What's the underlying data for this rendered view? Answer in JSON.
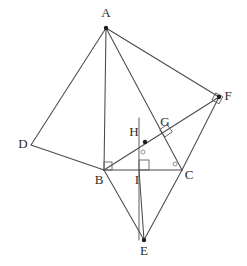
{
  "figure": {
    "canvas": {
      "width": 247,
      "height": 266
    },
    "style": {
      "background": "#ffffff",
      "line_color": "#4a4a4a",
      "label_color": "#2b2b2b",
      "mark_color": "#5a5a5a"
    },
    "points": [
      {
        "id": "A",
        "label": "A",
        "x": 106,
        "y": 28,
        "label_x": 106,
        "label_y": 14,
        "dot": true
      },
      {
        "id": "B",
        "label": "B",
        "x": 104,
        "y": 170,
        "label_x": 99,
        "label_y": 181,
        "dot": false
      },
      {
        "id": "C",
        "label": "C",
        "x": 182,
        "y": 170,
        "label_x": 189,
        "label_y": 176,
        "dot": false
      },
      {
        "id": "D",
        "label": "D",
        "x": 31,
        "y": 145,
        "label_x": 23,
        "label_y": 145,
        "dot": false
      },
      {
        "id": "E",
        "label": "E",
        "x": 144,
        "y": 240,
        "label_x": 144,
        "label_y": 252,
        "dot": true
      },
      {
        "id": "F",
        "label": "F",
        "x": 219,
        "y": 97,
        "label_x": 228,
        "label_y": 97,
        "dot": true
      },
      {
        "id": "G",
        "label": "G",
        "x": 168,
        "y": 135,
        "label_x": 165,
        "label_y": 123,
        "dot": false
      },
      {
        "id": "H",
        "label": "H",
        "x": 145,
        "y": 142,
        "label_x": 134,
        "label_y": 133,
        "dot": true
      },
      {
        "id": "I",
        "label": "I",
        "x": 139,
        "y": 170,
        "label_x": 137,
        "label_y": 181,
        "dot": false
      }
    ],
    "segments": [
      {
        "id": "AD",
        "from": "A",
        "to": "D"
      },
      {
        "id": "DB",
        "from": "D",
        "to": "B"
      },
      {
        "id": "AB",
        "from": "A",
        "to": "B"
      },
      {
        "id": "AC",
        "from": "A",
        "to": "C"
      },
      {
        "id": "AF",
        "from": "A",
        "to": "F"
      },
      {
        "id": "BF",
        "from": "B",
        "to": "F"
      },
      {
        "id": "FC",
        "from": "F",
        "to": "C"
      },
      {
        "id": "BC",
        "from": "B",
        "to": "C"
      },
      {
        "id": "BE",
        "from": "B",
        "to": "E"
      },
      {
        "id": "CE",
        "from": "C",
        "to": "E"
      },
      {
        "id": "IE",
        "from": "I",
        "to": "E"
      }
    ],
    "extra_lines": [
      {
        "id": "vertical-through-I",
        "x1": 139,
        "y1": 118,
        "x2": 139,
        "y2": 240
      }
    ],
    "angle_marks": [
      {
        "id": "right-angle-at-B",
        "type": "square",
        "x": 104,
        "y": 170,
        "size": 8,
        "rotation": 0
      },
      {
        "id": "right-angle-at-I",
        "type": "square",
        "x": 139,
        "y": 170,
        "size": 10,
        "rotation": 0
      },
      {
        "id": "right-angle-at-G",
        "type": "square",
        "x": 165,
        "y": 137,
        "size": 9,
        "rotation": -36
      },
      {
        "id": "right-angle-at-F",
        "type": "square",
        "x": 212,
        "y": 100,
        "size": 8,
        "rotation": 28
      },
      {
        "id": "angle-dot-at-H",
        "type": "dot",
        "x": 143,
        "y": 152,
        "size": 2
      },
      {
        "id": "angle-dot-at-C",
        "type": "dot",
        "x": 175,
        "y": 164,
        "size": 2
      }
    ],
    "caption": ""
  }
}
